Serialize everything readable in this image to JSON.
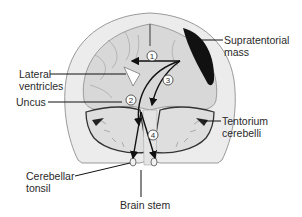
{
  "diagram": {
    "type": "anatomical-cross-section",
    "labels": {
      "supratentorial_mass": [
        "Supratentorial",
        "mass"
      ],
      "lateral_ventricles": [
        "Lateral",
        "ventricles"
      ],
      "uncus": "Uncus",
      "tentorium_cerebelli": [
        "Tentorium",
        "cerebelli"
      ],
      "cerebellar_tonsil": [
        "Cerebellar",
        "tonsil"
      ],
      "brain_stem": "Brain stem"
    },
    "markers": [
      {
        "id": "1",
        "label": "1"
      },
      {
        "id": "2",
        "label": "2"
      },
      {
        "id": "3",
        "label": "3"
      },
      {
        "id": "4",
        "label": "4"
      }
    ],
    "colors": {
      "background": "#ffffff",
      "skull": "#e6e6e6",
      "brain": "#d9d9d9",
      "mass": "#111111",
      "lines": "#111111",
      "ventricle": "#ffffff"
    }
  }
}
